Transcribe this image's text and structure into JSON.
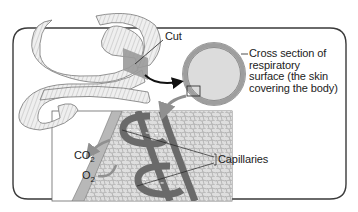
{
  "diagram": {
    "labels": {
      "cut": "Cut",
      "cross_section": [
        "Cross section of",
        "respiratory",
        "surface (the skin",
        "covering the body)"
      ],
      "capillaries": "Capillaries",
      "co2": {
        "base": "CO",
        "sub": "2"
      },
      "o2": {
        "base": "O",
        "sub": "2"
      }
    },
    "colors": {
      "frame": "#3a3a3a",
      "worm_fill": "#ebebeb",
      "worm_line": "#777777",
      "cut_plane": "#9a9a9a",
      "ring_outer": "#9e9e9e",
      "ring_inner": "#dcdcdc",
      "tissue": "#d8d8d8",
      "capillary": "#6a6a6a",
      "arrow": "#909090"
    }
  }
}
